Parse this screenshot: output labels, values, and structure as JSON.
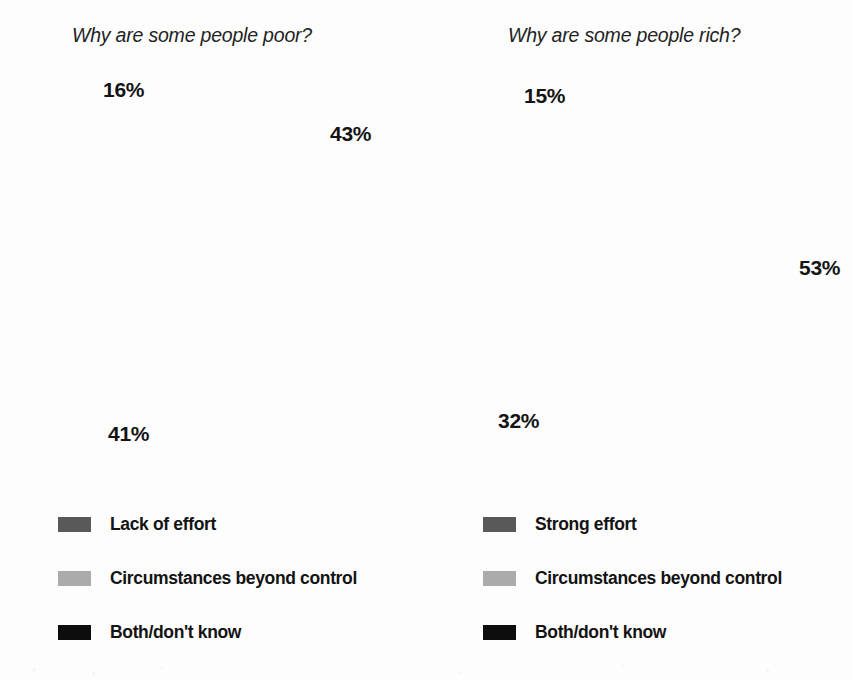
{
  "chart_data": [
    {
      "type": "pie",
      "title": "Why are some people poor?",
      "categories": [
        "Lack of effort",
        "Circumstances beyond control",
        "Both/don't know"
      ],
      "values": [
        43,
        41,
        16
      ],
      "value_labels": [
        "43%",
        "41%",
        "16%"
      ],
      "colors": [
        "#595959",
        "#ababab",
        "#0d0d0d"
      ],
      "start_angle_deg": 0,
      "direction": "clockwise",
      "legend_position": "bottom-left",
      "xlabel": "",
      "ylabel": "",
      "grid": false
    },
    {
      "type": "pie",
      "title": "Why are some people rich?",
      "categories": [
        "Strong effort",
        "Circumstances beyond control",
        "Both/don't know"
      ],
      "values": [
        53,
        32,
        15
      ],
      "value_labels": [
        "53%",
        "32%",
        "15%"
      ],
      "colors": [
        "#595959",
        "#ababab",
        "#0d0d0d"
      ],
      "start_angle_deg": 0,
      "direction": "clockwise",
      "legend_position": "bottom-left",
      "xlabel": "",
      "ylabel": "",
      "grid": false
    }
  ],
  "left": {
    "title": "Why are some people poor?",
    "slices": {
      "dark": {
        "label": "Lack of effort",
        "pct_text": "43%",
        "value": 43,
        "color": "#595959"
      },
      "light": {
        "label": "Circumstances beyond control",
        "pct_text": "41%",
        "value": 41,
        "color": "#ababab"
      },
      "black": {
        "label": "Both/don't know",
        "pct_text": "16%",
        "value": 16,
        "color": "#0d0d0d"
      }
    },
    "legend": [
      {
        "label": "Lack of effort",
        "color": "#595959"
      },
      {
        "label": "Circumstances beyond control",
        "color": "#ababab"
      },
      {
        "label": "Both/don't know",
        "color": "#0d0d0d"
      }
    ]
  },
  "right": {
    "title": "Why are some people rich?",
    "slices": {
      "dark": {
        "label": "Strong effort",
        "pct_text": "53%",
        "value": 53,
        "color": "#595959"
      },
      "light": {
        "label": "Circumstances beyond control",
        "pct_text": "32%",
        "value": 32,
        "color": "#ababab"
      },
      "black": {
        "label": "Both/don't know",
        "pct_text": "15%",
        "value": 15,
        "color": "#0d0d0d"
      }
    },
    "legend": [
      {
        "label": "Strong effort",
        "color": "#595959"
      },
      {
        "label": "Circumstances beyond control",
        "color": "#ababab"
      },
      {
        "label": "Both/don't know",
        "color": "#0d0d0d"
      }
    ]
  },
  "palette": {
    "dark_gray": "#595959",
    "light_gray": "#ababab",
    "black": "#0d0d0d",
    "background": "#ffffff",
    "text": "#141414"
  }
}
